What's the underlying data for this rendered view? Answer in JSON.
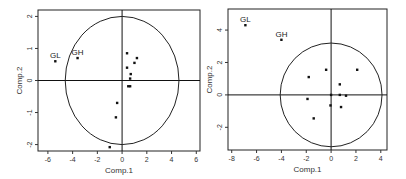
{
  "chart_data": [
    {
      "type": "scatter",
      "title": "",
      "xlabel": "Comp.1",
      "ylabel": "Comp.2",
      "xlim": [
        -6.8,
        6.3
      ],
      "ylim": [
        -2.2,
        2.2
      ],
      "xticks": [
        -6,
        -4,
        -2,
        0,
        2,
        4,
        6
      ],
      "yticks": [
        -2,
        -1,
        0,
        1,
        2
      ],
      "circle": {
        "cx": 0,
        "cy": 0,
        "rx": 4.6,
        "ry": 2.0
      },
      "points": [
        {
          "x": -5.4,
          "y": 0.6,
          "label": "GL"
        },
        {
          "x": -3.6,
          "y": 0.7,
          "label": "GH"
        },
        {
          "x": 0.4,
          "y": 0.85,
          "label": ""
        },
        {
          "x": 1.2,
          "y": 0.7,
          "label": ""
        },
        {
          "x": 1.0,
          "y": 0.55,
          "label": ""
        },
        {
          "x": 0.4,
          "y": 0.4,
          "label": ""
        },
        {
          "x": 0.7,
          "y": 0.2,
          "label": ""
        },
        {
          "x": 0.65,
          "y": 0.06,
          "label": ""
        },
        {
          "x": 0.5,
          "y": -0.18,
          "label": ""
        },
        {
          "x": 0.65,
          "y": -0.18,
          "label": ""
        },
        {
          "x": -0.4,
          "y": -0.7,
          "label": ""
        },
        {
          "x": -0.5,
          "y": -1.15,
          "label": ""
        },
        {
          "x": -1.0,
          "y": -2.08,
          "label": ""
        }
      ],
      "grid": false
    },
    {
      "type": "scatter",
      "title": "",
      "xlabel": "Comp.1",
      "ylabel": "Comp.2",
      "xlim": [
        -8.3,
        4.5
      ],
      "ylim": [
        -3.4,
        5.3
      ],
      "xticks": [
        -8,
        -6,
        -4,
        -2,
        0,
        2,
        4
      ],
      "yticks": [
        -2,
        0,
        2,
        4
      ],
      "circle": {
        "cx": 0,
        "cy": 0,
        "rx": 4.1,
        "ry": 3.2
      },
      "points": [
        {
          "x": -6.9,
          "y": 4.3,
          "label": "GL"
        },
        {
          "x": -4.0,
          "y": 3.4,
          "label": "GH"
        },
        {
          "x": -0.4,
          "y": 1.55,
          "label": ""
        },
        {
          "x": 2.1,
          "y": 1.55,
          "label": ""
        },
        {
          "x": -1.8,
          "y": 1.1,
          "label": ""
        },
        {
          "x": 0.7,
          "y": 0.65,
          "label": ""
        },
        {
          "x": 0.0,
          "y": 0.0,
          "label": ""
        },
        {
          "x": 0.7,
          "y": 0.0,
          "label": ""
        },
        {
          "x": 1.2,
          "y": -0.05,
          "label": ""
        },
        {
          "x": -1.9,
          "y": -0.25,
          "label": ""
        },
        {
          "x": -0.05,
          "y": -0.65,
          "label": ""
        },
        {
          "x": 0.8,
          "y": -0.75,
          "label": ""
        },
        {
          "x": -1.4,
          "y": -1.45,
          "label": ""
        }
      ],
      "grid": false
    }
  ]
}
